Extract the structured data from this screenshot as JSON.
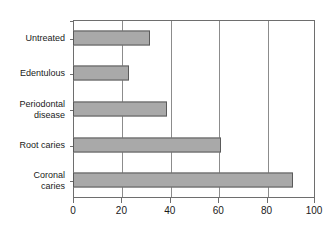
{
  "chart_data": {
    "type": "bar",
    "orientation": "horizontal",
    "title": "",
    "subtitle": "",
    "xlabel": "",
    "ylabel": "",
    "xlim": [
      0,
      100
    ],
    "xticks": [
      0,
      20,
      40,
      60,
      80,
      100
    ],
    "xtick_labels": [
      "0",
      "20",
      "40",
      "60",
      "80",
      "100"
    ],
    "grid": "vertical",
    "legend": "none",
    "bar_color": "#a9a9a9",
    "bar_edge_color": "#5a5a5a",
    "axis_color": "#6e6e6e",
    "categories": [
      "Untreated",
      "Edentulous",
      "Periodontal\ndisease",
      "Root caries",
      "Coronal\ncaries"
    ],
    "values": [
      32,
      23,
      39,
      61,
      91
    ],
    "series": [
      {
        "name": "",
        "values": [
          32,
          23,
          39,
          61,
          91
        ]
      }
    ]
  }
}
